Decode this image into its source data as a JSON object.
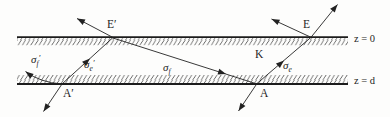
{
  "figure": {
    "colors": {
      "background": "#fdfdfc",
      "ink": "#222222"
    },
    "labels": {
      "sigma_f_prime": {
        "base": "σ",
        "sub": "f",
        "prime": "′"
      },
      "sigma_e_prime": {
        "base": "σ",
        "sub": "e",
        "prime": "′"
      },
      "sigma_f": {
        "base": "σ",
        "sub": "f",
        "prime": ""
      },
      "sigma_e": {
        "base": "σ",
        "sub": "e",
        "prime": ""
      },
      "medium": "K",
      "point_E_prime": "E′",
      "point_E": "E",
      "point_A_prime": "A′",
      "point_A": "A",
      "surface_top": "z = 0",
      "surface_bottom": "z = d"
    }
  }
}
